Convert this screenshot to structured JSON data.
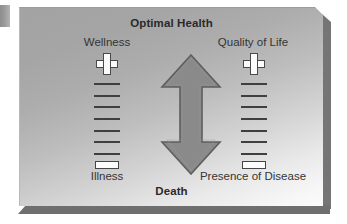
{
  "figure": {
    "type": "diagram",
    "title_top": "Optimal Health",
    "title_bottom": "Death",
    "scales": [
      {
        "id": "wellness-illness",
        "top_label": "Wellness",
        "bottom_label": "Illness",
        "top_symbol": "plus-icon",
        "bottom_symbol": "minus-icon",
        "tick_count": 7
      },
      {
        "id": "quality-of-life-presence-of-disease",
        "top_label": "Quality of Life",
        "bottom_label": "Presence of Disease",
        "top_symbol": "plus-icon",
        "bottom_symbol": "minus-icon",
        "tick_count": 7
      }
    ],
    "center": {
      "icon": "double-headed-vertical-arrow-icon",
      "meaning": "continuum between Optimal Health and Death"
    },
    "colors": {
      "panel_top": "#a3a3a3",
      "panel_bottom": "#fbfbfb",
      "arrow_fill": "#8a8a8a",
      "arrow_stroke": "#5e5e5e",
      "text": "#2a2a2a",
      "tick": "#3f3f3f",
      "symbol_fill": "#fbfbfb",
      "symbol_stroke": "#4a4a4a",
      "shadow": "#6f6f6f",
      "tab": "#9a9a9a"
    }
  }
}
